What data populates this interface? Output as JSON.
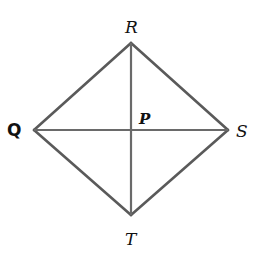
{
  "diagram": {
    "type": "rhombus-with-diagonals",
    "vertices": [
      {
        "label": "R",
        "x": 131,
        "y": 43,
        "position": "top"
      },
      {
        "label": "S",
        "x": 228,
        "y": 130,
        "position": "right"
      },
      {
        "label": "T",
        "x": 131,
        "y": 215,
        "position": "bottom"
      },
      {
        "label": "Q",
        "x": 34,
        "y": 130,
        "position": "left"
      }
    ],
    "intersection": {
      "label": "P",
      "x": 131,
      "y": 130
    },
    "edges": [
      "QR",
      "RS",
      "ST",
      "TQ"
    ],
    "diagonals": [
      "RT",
      "QS"
    ],
    "line_color": "#5a5a5a"
  },
  "labels": {
    "R": "R",
    "S": "S",
    "T": "T",
    "Q": "Q",
    "P": "P"
  }
}
